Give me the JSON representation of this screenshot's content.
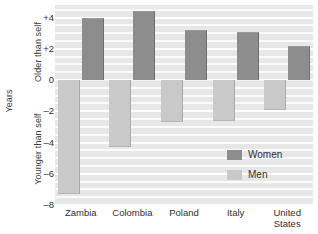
{
  "chart_data": {
    "type": "bar",
    "title": "",
    "subtitle": "",
    "xlabel": "",
    "ylabel": "Years",
    "ylabel_top": "Older than self",
    "ylabel_bottom": "Younger than self",
    "categories": [
      "Zambia",
      "Colombia",
      "Poland",
      "Italy",
      "United\nStates"
    ],
    "series": [
      {
        "name": "Women",
        "color": "#8d8d8d",
        "values": [
          4.0,
          4.4,
          3.2,
          3.1,
          2.2
        ]
      },
      {
        "name": "Men",
        "color": "#c9c9c9",
        "values": [
          -7.3,
          -4.3,
          -2.7,
          -2.65,
          -1.9
        ]
      }
    ],
    "ylim": [
      -8,
      4.8
    ],
    "yticks": [
      4,
      2,
      0,
      -2,
      -4,
      -6,
      -8
    ],
    "ytick_labels": [
      "+4",
      "+2",
      "0",
      "–2",
      "–4",
      "–6",
      "–8"
    ],
    "grid": true,
    "grid_minor": true,
    "legend_position": "inside-bottom-right",
    "background_color": "#e7e7e7",
    "gridline_color": "#ffffff"
  },
  "legend": {
    "items": [
      {
        "label": "Women",
        "color": "#8d8d8d"
      },
      {
        "label": "Men",
        "color": "#c9c9c9"
      }
    ]
  }
}
